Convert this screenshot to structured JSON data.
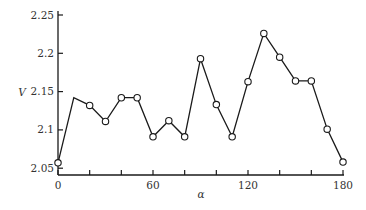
{
  "chart_data": {
    "type": "line",
    "title": "",
    "xlabel": "α",
    "ylabel": "V",
    "xlim": [
      0,
      180
    ],
    "ylim": [
      2.04,
      2.25
    ],
    "grid": false,
    "legend": null,
    "x_ticks": [
      0,
      20,
      40,
      60,
      80,
      100,
      120,
      140,
      160,
      180
    ],
    "x_tick_labels": [
      {
        "value": 0,
        "label": "0"
      },
      {
        "value": 60,
        "label": "60"
      },
      {
        "value": 120,
        "label": "120"
      },
      {
        "value": 180,
        "label": "180"
      }
    ],
    "y_ticks": [
      {
        "value": 2.05,
        "label": "2.05"
      },
      {
        "value": 2.1,
        "label": "2.1"
      },
      {
        "value": 2.15,
        "label": "2.15"
      },
      {
        "value": 2.2,
        "label": "2.2"
      },
      {
        "value": 2.25,
        "label": "2.25"
      }
    ],
    "series": [
      {
        "name": "V",
        "x": [
          0,
          10,
          20,
          30,
          40,
          50,
          60,
          70,
          80,
          90,
          100,
          110,
          120,
          130,
          140,
          150,
          160,
          170,
          180
        ],
        "values": [
          2.057,
          2.142,
          2.132,
          2.111,
          2.142,
          2.142,
          2.091,
          2.112,
          2.091,
          2.193,
          2.133,
          2.091,
          2.163,
          2.226,
          2.195,
          2.164,
          2.164,
          2.101,
          2.058
        ],
        "marker": "open-circle",
        "marker_hidden_at": [
          10
        ]
      }
    ]
  }
}
